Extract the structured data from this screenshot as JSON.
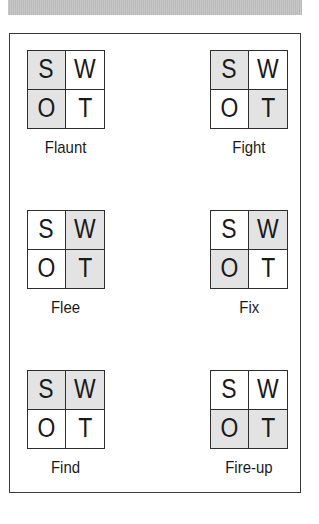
{
  "header_bar": {
    "color": "#c2c2c2"
  },
  "colors": {
    "shade": "#e3e3e3",
    "border": "#2e2e2e",
    "text": "#1a1a1a"
  },
  "swot_letters": [
    "S",
    "W",
    "O",
    "T"
  ],
  "strategies": [
    {
      "label": "Flaunt",
      "grid": {
        "S": "S",
        "W": "W",
        "O": "O",
        "T": "T"
      },
      "shaded": [
        "S",
        "O"
      ]
    },
    {
      "label": "Fight",
      "grid": {
        "S": "S",
        "W": "W",
        "O": "O",
        "T": "T"
      },
      "shaded": [
        "S",
        "T"
      ]
    },
    {
      "label": "Flee",
      "grid": {
        "S": "S",
        "W": "W",
        "O": "O",
        "T": "T"
      },
      "shaded": [
        "W",
        "T"
      ]
    },
    {
      "label": "Fix",
      "grid": {
        "S": "S",
        "W": "W",
        "O": "O",
        "T": "T"
      },
      "shaded": [
        "W",
        "O"
      ]
    },
    {
      "label": "Find",
      "grid": {
        "S": "S",
        "W": "W",
        "O": "O",
        "T": "T"
      },
      "shaded": [
        "S",
        "W"
      ]
    },
    {
      "label": "Fire-up",
      "grid": {
        "S": "S",
        "W": "W",
        "O": "O",
        "T": "T"
      },
      "shaded": [
        "O",
        "T"
      ]
    }
  ]
}
